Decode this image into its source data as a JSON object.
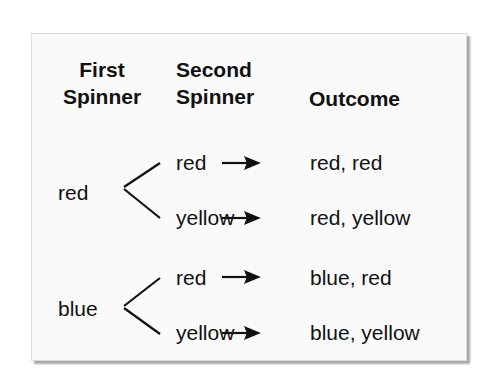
{
  "diagram": {
    "headers": {
      "first": [
        "First",
        "Spinner"
      ],
      "second": [
        "Second",
        "Spinner"
      ],
      "outcome": "Outcome"
    },
    "branches": [
      {
        "first": "red",
        "seconds": [
          {
            "label": "red",
            "outcome": "red, red"
          },
          {
            "label": "yellow",
            "outcome": "red, yellow"
          }
        ]
      },
      {
        "first": "blue",
        "seconds": [
          {
            "label": "red",
            "outcome": "blue, red"
          },
          {
            "label": "yellow",
            "outcome": "blue, yellow"
          }
        ]
      }
    ],
    "arrow_glyph": "→"
  }
}
